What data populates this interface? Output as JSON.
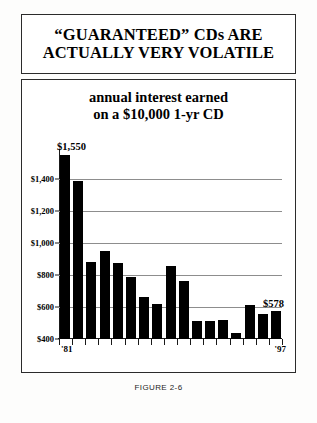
{
  "header": {
    "title_line1": "“GUARANTEED” CDs ARE",
    "title_line2": "ACTUALLY VERY VOLATILE"
  },
  "caption": "FIGURE 2-6",
  "colors": {
    "bar": "#000000",
    "gridline": "#8d8d8d",
    "axis": "#1a1a1a",
    "border": "#2b2b2b",
    "background": "#ffffff"
  },
  "annotations": {
    "peak_label": "$1,550",
    "end_label": "$578"
  },
  "chart_data": {
    "type": "bar",
    "title": "annual interest earned",
    "subtitle": "on a $10,000 1-yr CD",
    "xlabel": "",
    "ylabel": "",
    "categories": [
      "'81",
      "'82",
      "'83",
      "'84",
      "'85",
      "'86",
      "'87",
      "'88",
      "'89",
      "'90",
      "'91",
      "'92",
      "'93",
      "'94",
      "'95",
      "'96",
      "'97"
    ],
    "values": [
      1550,
      1390,
      880,
      950,
      875,
      790,
      665,
      620,
      855,
      760,
      515,
      510,
      520,
      440,
      610,
      555,
      578
    ],
    "ylim": [
      400,
      1550
    ],
    "yticks": [
      400,
      600,
      800,
      1000,
      1200,
      1400
    ],
    "ytick_labels": [
      "$400",
      "$600",
      "$800",
      "$1,000",
      "$1,200",
      "$1,400"
    ],
    "xtick_labels_shown": [
      "'81",
      "'97"
    ],
    "grid": true,
    "legend": false,
    "data_labels": [
      {
        "category": "'81",
        "value": 1550,
        "text": "$1,550"
      },
      {
        "category": "'97",
        "value": 578,
        "text": "$578"
      }
    ]
  }
}
